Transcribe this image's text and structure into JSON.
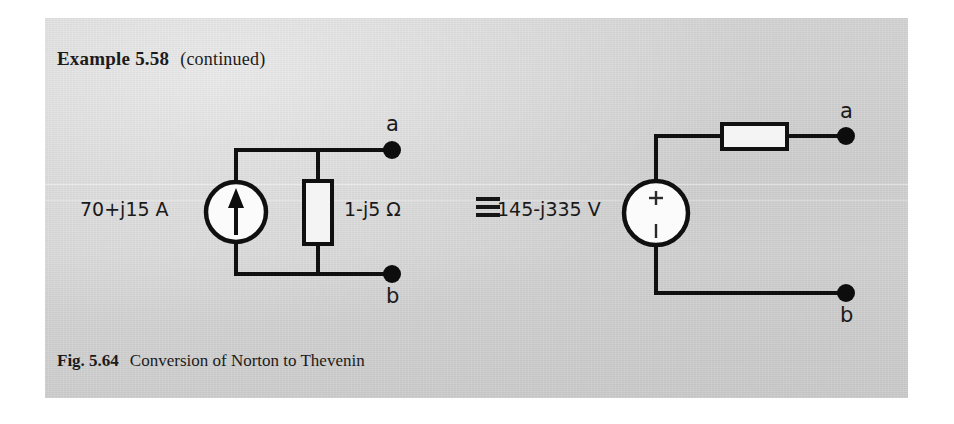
{
  "page": {
    "heading_label": "Example 5.58",
    "heading_note": "(continued)",
    "caption_label": "Fig. 5.64",
    "caption_text": "Conversion of Norton to Thevenin"
  },
  "norton_circuit": {
    "source_label": "70+j15 A",
    "source_type": "current-source",
    "source_arrow_direction": "up",
    "impedance_label": "1-j5 Ω",
    "terminal_a_label": "a",
    "terminal_b_label": "b"
  },
  "thevenin_circuit": {
    "source_label": "145-j335 V",
    "source_type": "voltage-source",
    "plus_sign": "+",
    "minus_sign": "−",
    "prefix_glyph": "triple-bar",
    "impedance_label": "",
    "terminal_a_label": "a",
    "terminal_b_label": "b"
  },
  "colors": {
    "paper": "#d0d0d0",
    "ink": "#101010",
    "component_fill": "#f4f4f4",
    "page_margin": "#ffffff"
  }
}
